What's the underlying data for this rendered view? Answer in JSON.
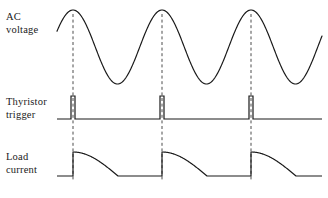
{
  "figure": {
    "title": "",
    "background_color": "#ffffff",
    "stroke_color": "#1a1a1a",
    "dash_color": "#4d4d4d"
  },
  "labels": {
    "ac_voltage": "AC\nvoltage",
    "thyristor_trigger": "Thyristor\ntrigger",
    "load_current": "Load\ncurrent"
  },
  "chart_data": {
    "type": "line",
    "title": "",
    "xlabel": "",
    "ylabel": "",
    "grid": false,
    "legend_position": "left-labels",
    "x_domain": [
      57,
      322
    ],
    "series": [
      {
        "name": "AC voltage",
        "waveform": "sine",
        "baseline_y": 47,
        "amplitude": 37,
        "period_px": 89,
        "peak_x": [
          73,
          162,
          251
        ],
        "x_start": 57,
        "x_end": 322,
        "color": "#1a1a1a"
      },
      {
        "name": "Thyristor trigger",
        "waveform": "pulse-train",
        "baseline_y": 119,
        "pulse_top_y": 96,
        "pulse_width_px": 4,
        "pulse_x": [
          73,
          162,
          251
        ],
        "x_start": 57,
        "x_end": 322,
        "color": "#1a1a1a"
      },
      {
        "name": "Load current",
        "waveform": "rectified-decay",
        "baseline_y": 176,
        "peak_y": 152,
        "pulse_start_x": [
          73,
          162,
          251
        ],
        "pulse_end_x": [
          118,
          207,
          296
        ],
        "x_start": 57,
        "x_end": 322,
        "color": "#1a1a1a"
      }
    ],
    "annotations": [
      {
        "type": "dashed-vline",
        "x": 73,
        "y_top": 14,
        "y_bottom": 181
      },
      {
        "type": "dashed-vline",
        "x": 162,
        "y_top": 14,
        "y_bottom": 181
      },
      {
        "type": "dashed-vline",
        "x": 251,
        "y_top": 14,
        "y_bottom": 181
      }
    ]
  }
}
